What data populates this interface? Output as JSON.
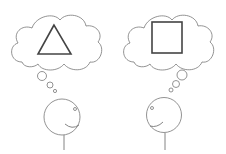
{
  "diagram": {
    "figures": [
      {
        "id": "left",
        "thought": "triangle",
        "facing": "right"
      },
      {
        "id": "right",
        "thought": "square",
        "facing": "left"
      }
    ],
    "colors": {
      "background": "#ffffff",
      "outline": "#777777",
      "shape": "#444444"
    }
  }
}
